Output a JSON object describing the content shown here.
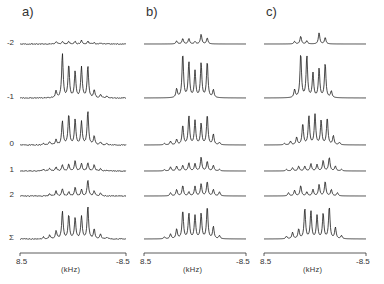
{
  "figure": {
    "panels": [
      {
        "label": "a)",
        "x_left": 20,
        "x_right": 126
      },
      {
        "label": "b)",
        "x_left": 144,
        "x_right": 246
      },
      {
        "label": "c)",
        "x_left": 264,
        "x_right": 366
      }
    ],
    "rows": [
      {
        "label": "-2",
        "baseline_y": 44
      },
      {
        "label": "-1",
        "baseline_y": 98
      },
      {
        "label": "0",
        "baseline_y": 145
      },
      {
        "label": "1",
        "baseline_y": 171
      },
      {
        "label": "2",
        "baseline_y": 196
      },
      {
        "label": "Σ",
        "baseline_y": 239
      }
    ],
    "axis": {
      "left_tick": "8.5",
      "right_tick": "-8.5",
      "unit": "(kHz)",
      "axis_y": 253
    },
    "colors": {
      "trace": "#1a1a1a",
      "axis": "#333333",
      "background": "#ffffff"
    }
  },
  "chart_data": {
    "type": "line",
    "title": "",
    "xlabel": "(kHz)",
    "xlim": [
      8.5,
      -8.5
    ],
    "x_tick_labels": [
      "8.5",
      "-8.5"
    ],
    "row_labels": [
      "-2",
      "-1",
      "0",
      "1",
      "2",
      "Σ"
    ],
    "panels": [
      {
        "label": "a)",
        "series": [
          {
            "name": "-2",
            "peaks": [
              [
                0.34,
                0.2
              ],
              [
                0.4,
                0.22
              ],
              [
                0.46,
                0.2
              ],
              [
                0.52,
                0.22
              ],
              [
                0.58,
                0.32
              ],
              [
                0.64,
                0.25
              ],
              [
                0.7,
                0.12
              ],
              [
                0.76,
                0.06
              ]
            ],
            "scale": 12
          },
          {
            "name": "-1",
            "peaks": [
              [
                0.34,
                0.15
              ],
              [
                0.4,
                1.0
              ],
              [
                0.46,
                0.75
              ],
              [
                0.52,
                0.6
              ],
              [
                0.58,
                0.7
              ],
              [
                0.64,
                0.72
              ],
              [
                0.7,
                0.18
              ],
              [
                0.76,
                0.08
              ],
              [
                0.82,
                0.04
              ]
            ],
            "scale": 44
          },
          {
            "name": "0",
            "peaks": [
              [
                0.22,
                0.05
              ],
              [
                0.28,
                0.1
              ],
              [
                0.34,
                0.15
              ],
              [
                0.4,
                0.7
              ],
              [
                0.46,
                0.9
              ],
              [
                0.52,
                0.75
              ],
              [
                0.58,
                0.68
              ],
              [
                0.64,
                1.0
              ],
              [
                0.7,
                0.25
              ],
              [
                0.76,
                0.08
              ],
              [
                0.82,
                0.04
              ]
            ],
            "scale": 34
          },
          {
            "name": "1",
            "peaks": [
              [
                0.22,
                0.12
              ],
              [
                0.28,
                0.2
              ],
              [
                0.34,
                0.3
              ],
              [
                0.4,
                0.45
              ],
              [
                0.46,
                0.5
              ],
              [
                0.52,
                0.7
              ],
              [
                0.58,
                0.55
              ],
              [
                0.64,
                0.6
              ],
              [
                0.7,
                0.45
              ],
              [
                0.76,
                0.15
              ],
              [
                0.82,
                0.06
              ]
            ],
            "scale": 14
          },
          {
            "name": "2",
            "peaks": [
              [
                0.28,
                0.15
              ],
              [
                0.34,
                0.3
              ],
              [
                0.4,
                0.45
              ],
              [
                0.46,
                0.25
              ],
              [
                0.52,
                0.55
              ],
              [
                0.58,
                0.4
              ],
              [
                0.64,
                1.0
              ],
              [
                0.7,
                0.3
              ],
              [
                0.76,
                0.2
              ]
            ],
            "scale": 16
          },
          {
            "name": "Σ",
            "peaks": [
              [
                0.22,
                0.06
              ],
              [
                0.28,
                0.12
              ],
              [
                0.34,
                0.25
              ],
              [
                0.4,
                0.85
              ],
              [
                0.46,
                0.75
              ],
              [
                0.52,
                0.65
              ],
              [
                0.58,
                0.7
              ],
              [
                0.64,
                1.0
              ],
              [
                0.7,
                0.3
              ],
              [
                0.76,
                0.15
              ],
              [
                0.82,
                0.05
              ]
            ],
            "scale": 32
          }
        ]
      },
      {
        "label": "b)",
        "series": [
          {
            "name": "-2",
            "peaks": [
              [
                0.32,
                0.25
              ],
              [
                0.38,
                0.45
              ],
              [
                0.44,
                0.45
              ],
              [
                0.5,
                0.2
              ],
              [
                0.56,
                0.8
              ],
              [
                0.62,
                0.5
              ]
            ],
            "scale": 12
          },
          {
            "name": "-1",
            "peaks": [
              [
                0.32,
                0.2
              ],
              [
                0.38,
                1.0
              ],
              [
                0.44,
                0.8
              ],
              [
                0.5,
                0.6
              ],
              [
                0.56,
                0.78
              ],
              [
                0.62,
                0.82
              ],
              [
                0.68,
                0.18
              ]
            ],
            "scale": 44
          },
          {
            "name": "0",
            "peaks": [
              [
                0.2,
                0.05
              ],
              [
                0.26,
                0.12
              ],
              [
                0.32,
                0.18
              ],
              [
                0.38,
                0.65
              ],
              [
                0.44,
                0.95
              ],
              [
                0.5,
                0.8
              ],
              [
                0.56,
                0.7
              ],
              [
                0.62,
                1.0
              ],
              [
                0.68,
                0.35
              ],
              [
                0.74,
                0.08
              ]
            ],
            "scale": 30
          },
          {
            "name": "1",
            "peaks": [
              [
                0.2,
                0.08
              ],
              [
                0.26,
                0.25
              ],
              [
                0.32,
                0.3
              ],
              [
                0.38,
                0.35
              ],
              [
                0.44,
                0.5
              ],
              [
                0.5,
                0.45
              ],
              [
                0.56,
                0.85
              ],
              [
                0.62,
                0.6
              ],
              [
                0.68,
                0.35
              ],
              [
                0.74,
                0.1
              ]
            ],
            "scale": 16
          },
          {
            "name": "2",
            "peaks": [
              [
                0.26,
                0.2
              ],
              [
                0.32,
                0.4
              ],
              [
                0.38,
                0.65
              ],
              [
                0.44,
                0.25
              ],
              [
                0.5,
                0.6
              ],
              [
                0.56,
                0.75
              ],
              [
                0.62,
                0.9
              ],
              [
                0.68,
                0.4
              ],
              [
                0.74,
                0.25
              ]
            ],
            "scale": 16
          },
          {
            "name": "Σ",
            "peaks": [
              [
                0.2,
                0.06
              ],
              [
                0.26,
                0.15
              ],
              [
                0.32,
                0.3
              ],
              [
                0.38,
                0.88
              ],
              [
                0.44,
                0.78
              ],
              [
                0.5,
                0.72
              ],
              [
                0.56,
                0.78
              ],
              [
                0.62,
                1.0
              ],
              [
                0.68,
                0.38
              ],
              [
                0.74,
                0.1
              ]
            ],
            "scale": 32
          }
        ]
      },
      {
        "label": "c)",
        "series": [
          {
            "name": "-2",
            "peaks": [
              [
                0.3,
                0.2
              ],
              [
                0.36,
                0.6
              ],
              [
                0.42,
                0.25
              ],
              [
                0.54,
                0.85
              ],
              [
                0.6,
                0.5
              ]
            ],
            "scale": 13
          },
          {
            "name": "-1",
            "peaks": [
              [
                0.3,
                0.18
              ],
              [
                0.36,
                1.0
              ],
              [
                0.42,
                0.95
              ],
              [
                0.48,
                0.55
              ],
              [
                0.54,
                0.65
              ],
              [
                0.6,
                0.78
              ],
              [
                0.66,
                0.15
              ]
            ],
            "scale": 44
          },
          {
            "name": "0",
            "peaks": [
              [
                0.2,
                0.05
              ],
              [
                0.26,
                0.12
              ],
              [
                0.32,
                0.25
              ],
              [
                0.38,
                0.7
              ],
              [
                0.44,
                0.95
              ],
              [
                0.5,
                1.0
              ],
              [
                0.56,
                0.8
              ],
              [
                0.62,
                0.9
              ],
              [
                0.68,
                0.3
              ],
              [
                0.74,
                0.08
              ]
            ],
            "scale": 30
          },
          {
            "name": "1",
            "peaks": [
              [
                0.22,
                0.1
              ],
              [
                0.28,
                0.2
              ],
              [
                0.34,
                0.3
              ],
              [
                0.4,
                0.3
              ],
              [
                0.46,
                0.45
              ],
              [
                0.52,
                0.4
              ],
              [
                0.58,
                0.65
              ],
              [
                0.64,
                0.85
              ],
              [
                0.7,
                0.3
              ],
              [
                0.76,
                0.1
              ]
            ],
            "scale": 16
          },
          {
            "name": "2",
            "peaks": [
              [
                0.24,
                0.2
              ],
              [
                0.3,
                0.35
              ],
              [
                0.36,
                0.65
              ],
              [
                0.42,
                0.25
              ],
              [
                0.48,
                0.4
              ],
              [
                0.54,
                0.7
              ],
              [
                0.6,
                0.9
              ],
              [
                0.66,
                0.4
              ],
              [
                0.72,
                0.2
              ]
            ],
            "scale": 16
          },
          {
            "name": "Σ",
            "peaks": [
              [
                0.22,
                0.08
              ],
              [
                0.28,
                0.2
              ],
              [
                0.34,
                0.3
              ],
              [
                0.4,
                0.95
              ],
              [
                0.46,
                0.85
              ],
              [
                0.52,
                0.72
              ],
              [
                0.58,
                0.78
              ],
              [
                0.64,
                1.0
              ],
              [
                0.7,
                0.35
              ],
              [
                0.76,
                0.1
              ]
            ],
            "scale": 32
          }
        ]
      }
    ],
    "grid": false,
    "legend": "row labels on left of panel a"
  }
}
